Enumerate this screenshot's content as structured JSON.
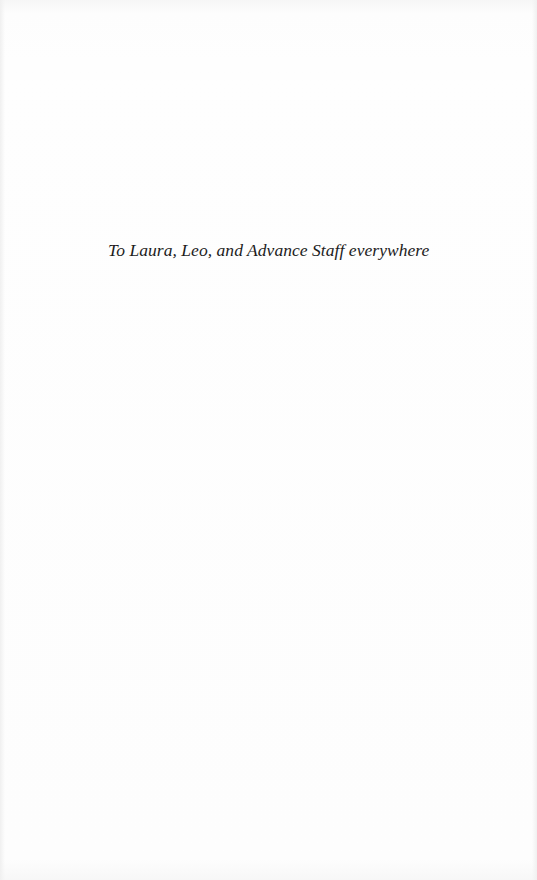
{
  "page": {
    "type": "dedication",
    "background_color": "#fdfdfd",
    "text_color": "#1c1c1c"
  },
  "dedication": {
    "text": "To Laura, Leo, and Advance Staff everywhere"
  }
}
